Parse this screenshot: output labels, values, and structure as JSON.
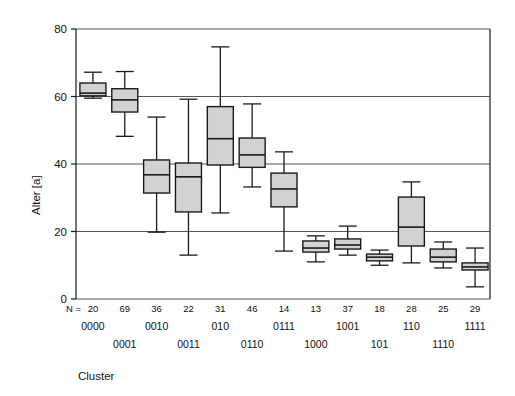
{
  "chart_data": {
    "type": "box",
    "title": "",
    "xlabel": "Cluster",
    "ylabel": "Alter [a]",
    "ylim": [
      0,
      80
    ],
    "yticks": [
      0,
      20,
      40,
      60,
      80
    ],
    "grid": "horizontal",
    "n_prefix": "N =",
    "categories": [
      "0000",
      "0001",
      "0010",
      "0011",
      "010",
      "0110",
      "0111",
      "1000",
      "1001",
      "101",
      "110",
      "1110",
      "1111"
    ],
    "counts": [
      20,
      69,
      36,
      22,
      31,
      46,
      14,
      13,
      37,
      18,
      28,
      25,
      29
    ],
    "boxes": [
      {
        "cluster": "0000",
        "n": 20,
        "whisker_low": 59.5,
        "q1": 60.2,
        "median": 61.0,
        "q3": 64.0,
        "whisker_high": 67.2
      },
      {
        "cluster": "0001",
        "n": 69,
        "whisker_low": 48.2,
        "q1": 55.4,
        "median": 59.0,
        "q3": 62.3,
        "whisker_high": 67.4
      },
      {
        "cluster": "0010",
        "n": 36,
        "whisker_low": 19.8,
        "q1": 31.4,
        "median": 36.8,
        "q3": 41.2,
        "whisker_high": 53.9
      },
      {
        "cluster": "0011",
        "n": 22,
        "whisker_low": 13.0,
        "q1": 25.8,
        "median": 36.2,
        "q3": 40.3,
        "whisker_high": 59.2
      },
      {
        "cluster": "010",
        "n": 31,
        "whisker_low": 25.5,
        "q1": 39.7,
        "median": 47.5,
        "q3": 57.0,
        "whisker_high": 74.7
      },
      {
        "cluster": "0110",
        "n": 46,
        "whisker_low": 33.2,
        "q1": 39.0,
        "median": 42.7,
        "q3": 47.7,
        "whisker_high": 57.8
      },
      {
        "cluster": "0111",
        "n": 14,
        "whisker_low": 14.2,
        "q1": 27.3,
        "median": 32.6,
        "q3": 37.3,
        "whisker_high": 43.6
      },
      {
        "cluster": "1000",
        "n": 13,
        "whisker_low": 11.0,
        "q1": 13.9,
        "median": 15.1,
        "q3": 17.2,
        "whisker_high": 18.7
      },
      {
        "cluster": "1001",
        "n": 37,
        "whisker_low": 13.0,
        "q1": 14.8,
        "median": 16.0,
        "q3": 17.8,
        "whisker_high": 21.6
      },
      {
        "cluster": "101",
        "n": 18,
        "whisker_low": 10.0,
        "q1": 11.3,
        "median": 12.4,
        "q3": 13.3,
        "whisker_high": 14.5
      },
      {
        "cluster": "110",
        "n": 28,
        "whisker_low": 10.7,
        "q1": 15.7,
        "median": 21.3,
        "q3": 30.2,
        "whisker_high": 34.7
      },
      {
        "cluster": "1110",
        "n": 25,
        "whisker_low": 9.2,
        "q1": 11.0,
        "median": 12.4,
        "q3": 14.8,
        "whisker_high": 16.9
      },
      {
        "cluster": "1111",
        "n": 29,
        "whisker_low": 3.6,
        "q1": 8.6,
        "median": 9.5,
        "q3": 10.7,
        "whisker_high": 15.1
      }
    ],
    "colors": {
      "box_fill": "#d2d2d2",
      "line": "#1a1a1a",
      "grid": "#555555",
      "background": "#ffffff"
    }
  },
  "axis": {
    "y_title": "Alter [a]",
    "x_title": "Cluster",
    "y_ticks": [
      "0",
      "20",
      "40",
      "60",
      "80"
    ]
  },
  "n_row": {
    "prefix": "N =",
    "values": [
      "20",
      "69",
      "36",
      "22",
      "31",
      "46",
      "14",
      "13",
      "37",
      "18",
      "28",
      "25",
      "29"
    ]
  },
  "cluster_rows": {
    "top": [
      "0000",
      "0010",
      "010",
      "0111",
      "1001",
      "110",
      "1111"
    ],
    "bottom": [
      "0001",
      "0011",
      "0110",
      "1000",
      "101",
      "1110"
    ]
  }
}
